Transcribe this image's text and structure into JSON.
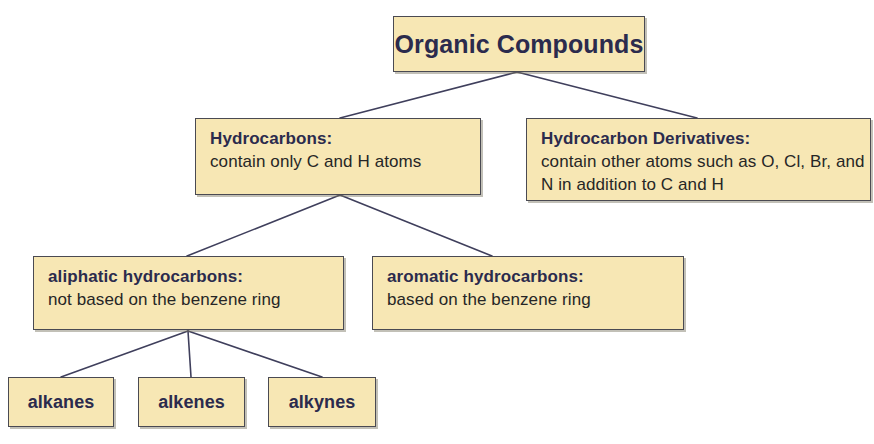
{
  "diagram": {
    "type": "hierarchy-tree",
    "colors": {
      "box_fill": "#f7e7b4",
      "box_border": "#4a4a52",
      "title_text": "#2b2b4d",
      "body_text": "#262626",
      "connector_line": "#3f3f5c",
      "background": "#ffffff"
    },
    "nodes": {
      "root": {
        "title": "Organic Compounds"
      },
      "hydrocarbons": {
        "title": "Hydrocarbons:",
        "desc": "contain only C and H atoms"
      },
      "derivatives": {
        "title": "Hydrocarbon Derivatives:",
        "desc": "contain other atoms such as O, Cl, Br, and N in addition to C and H"
      },
      "aliphatic": {
        "title": "aliphatic hydrocarbons:",
        "desc": "not based on the benzene ring"
      },
      "aromatic": {
        "title": "aromatic hydrocarbons:",
        "desc": "based on the benzene ring"
      },
      "alkanes": {
        "title": "alkanes"
      },
      "alkenes": {
        "title": "alkenes"
      },
      "alkynes": {
        "title": "alkynes"
      }
    },
    "edges": [
      {
        "from": "root",
        "to": "hydrocarbons"
      },
      {
        "from": "root",
        "to": "derivatives"
      },
      {
        "from": "hydrocarbons",
        "to": "aliphatic"
      },
      {
        "from": "hydrocarbons",
        "to": "aromatic"
      },
      {
        "from": "aliphatic",
        "to": "alkanes"
      },
      {
        "from": "aliphatic",
        "to": "alkenes"
      },
      {
        "from": "aliphatic",
        "to": "alkynes"
      }
    ]
  }
}
